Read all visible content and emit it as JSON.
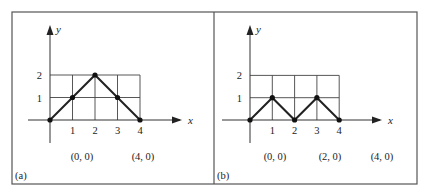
{
  "figure": {
    "frame": {
      "x": 12,
      "y": 12,
      "width": 405,
      "height": 172,
      "divider_x": 214,
      "color": "#555555"
    },
    "panels": [
      {
        "id": "a",
        "label": "(a)",
        "origin": {
          "x": 50,
          "y": 120
        },
        "unit": 22.5,
        "x_axis_label": "x",
        "y_axis_label": "y",
        "x_ticks": [
          "1",
          "2",
          "3",
          "4"
        ],
        "y_ticks": [
          "1",
          "2"
        ],
        "points": [
          [
            0,
            0
          ],
          [
            1,
            1
          ],
          [
            2,
            2
          ],
          [
            3,
            1
          ],
          [
            4,
            0
          ]
        ],
        "coord_labels": [
          {
            "text": "(0, 0)",
            "x": 82
          },
          {
            "text": "(4, 0)",
            "x": 143
          }
        ]
      },
      {
        "id": "b",
        "label": "(b)",
        "origin": {
          "x": 250,
          "y": 120
        },
        "unit": 22.3,
        "x_axis_label": "x",
        "y_axis_label": "y",
        "x_ticks": [
          "1",
          "2",
          "3",
          "4"
        ],
        "y_ticks": [
          "1",
          "2"
        ],
        "points": [
          [
            0,
            0
          ],
          [
            1,
            1
          ],
          [
            2,
            0
          ],
          [
            3,
            1
          ],
          [
            4,
            0
          ]
        ],
        "coord_labels": [
          {
            "text": "(0, 0)",
            "x": 275
          },
          {
            "text": "(2, 0)",
            "x": 330
          },
          {
            "text": "(4, 0)",
            "x": 382
          }
        ]
      }
    ]
  },
  "chart_data": [
    {
      "type": "line",
      "title": "(a)",
      "xlabel": "x",
      "ylabel": "y",
      "x": [
        0,
        1,
        2,
        3,
        4
      ],
      "values": [
        0,
        1,
        2,
        1,
        0
      ],
      "xlim": [
        0,
        4
      ],
      "ylim": [
        0,
        2
      ],
      "grid": true,
      "annotations": [
        "(0, 0)",
        "(4, 0)"
      ]
    },
    {
      "type": "line",
      "title": "(b)",
      "xlabel": "x",
      "ylabel": "y",
      "x": [
        0,
        1,
        2,
        3,
        4
      ],
      "values": [
        0,
        1,
        0,
        1,
        0
      ],
      "xlim": [
        0,
        4
      ],
      "ylim": [
        0,
        2
      ],
      "grid": true,
      "annotations": [
        "(0, 0)",
        "(2, 0)",
        "(4, 0)"
      ]
    }
  ]
}
